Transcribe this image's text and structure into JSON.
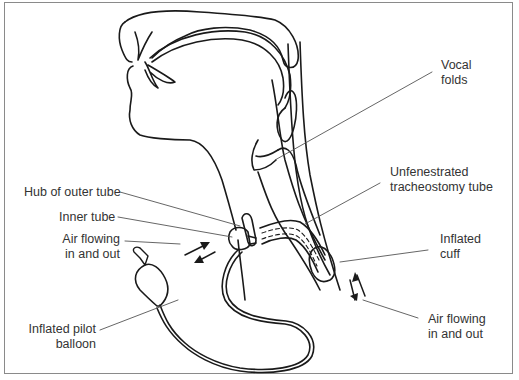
{
  "diagram": {
    "line_color": "#1a1a1a",
    "leader_color": "#555555",
    "text_color": "#333333",
    "border_color": "#8a8a8a"
  },
  "labels": {
    "vocal_folds": {
      "line1": "Vocal",
      "line2": "folds"
    },
    "hub_outer_tube": {
      "text": "Hub of outer tube"
    },
    "unfenestrated_tube": {
      "line1": "Unfenestrated",
      "line2": "tracheostomy tube"
    },
    "inner_tube": {
      "text": "Inner tube"
    },
    "air_flow_left": {
      "line1": "Air flowing",
      "line2": "in and out"
    },
    "inflated_cuff": {
      "line1": "Inflated",
      "line2": "cuff"
    },
    "pilot_balloon": {
      "line1": "Inflated pilot",
      "line2": "balloon"
    },
    "air_flow_right": {
      "line1": "Air flowing",
      "line2": "in and out"
    }
  }
}
